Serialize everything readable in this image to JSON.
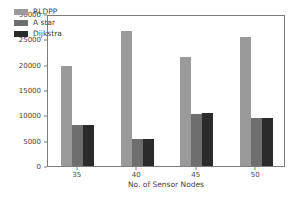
{
  "chart_data": {
    "type": "bar",
    "title": "",
    "xlabel": "No. of Sensor Nodes",
    "ylabel": "Network Lifetime (in requests)",
    "categories": [
      "35",
      "40",
      "45",
      "50"
    ],
    "ylim": [
      0,
      30000
    ],
    "yticks": [
      "0",
      "5000",
      "10000",
      "15000",
      "20000",
      "25000",
      "30000"
    ],
    "ytick_values": [
      0,
      5000,
      10000,
      15000,
      20000,
      25000,
      30000
    ],
    "grid": false,
    "legend_position": "upper left",
    "series": [
      {
        "name": "RLDPP",
        "color": "#9a9a9a",
        "values": [
          19700,
          26600,
          21600,
          25500
        ]
      },
      {
        "name": "A star",
        "color": "#6e6e6e",
        "values": [
          8100,
          5300,
          10300,
          9400
        ]
      },
      {
        "name": "Dijkstra",
        "color": "#2b2b2b",
        "values": [
          8100,
          5350,
          10400,
          9400
        ]
      }
    ]
  }
}
